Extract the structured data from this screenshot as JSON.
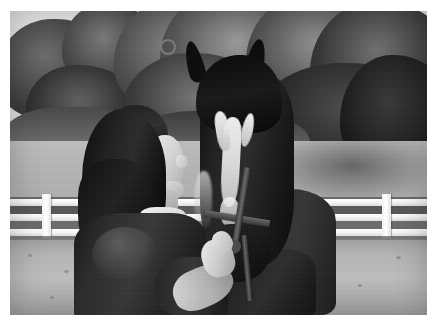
{
  "image": {
    "kind": "photograph",
    "color_mode": "black-and-white",
    "orientation": "landscape",
    "width_px": 437,
    "height_px": 326,
    "border": {
      "style": "white photo print border",
      "color": "#ffffff",
      "thickness_px": 10
    },
    "alt_text": "Black and white photo of a dark-haired woman facing a dark horse with a white blaze, standing in a fenced pasture with trees behind.",
    "subjects": [
      {
        "name": "woman",
        "description": "Woman with long dark hair in profile, wearing a dark collared short-sleeve shirt, looking up at the horse and reaching her hand toward its muzzle.",
        "position": "left of center, foreground"
      },
      {
        "name": "horse",
        "description": "Dark bay or black horse head-on, wearing a halter, with a broad white blaze running down the face.",
        "position": "center right, foreground"
      }
    ],
    "scene": {
      "setting": "horse pasture / paddock on a sunny day",
      "elements": [
        "bright overcast sky patch at upper left",
        "dense deciduous tree canopy across the background",
        "mown grass lawn in the midground",
        "white three-rail wooden post fence",
        "dry dirt and sparse grass in the foreground",
        "strong tree shadow falling across the lawn at right"
      ],
      "lighting": "bright daylight, high contrast, sun from the left",
      "fence": {
        "rails": 3,
        "color": "#f7f7f7",
        "posts_visible": 5
      }
    },
    "tones": {
      "sky": "#e6e6e6",
      "lawn": "#b4b4b4",
      "dirt": "#bababa",
      "fence": "#f7f7f7",
      "horse": "#1f1f1f",
      "hair": "#1a1a1a",
      "shirt": "#2f2f2f",
      "skin": "#d8d8d8",
      "blaze": "#eeeeee",
      "trees": "#4a4a4a"
    }
  }
}
